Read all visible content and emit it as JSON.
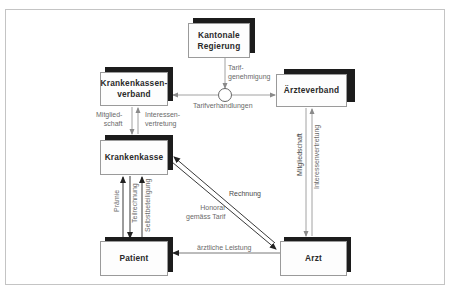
{
  "diagram": {
    "nodes": {
      "kantonale_regierung": "Kantonale\nRegierung",
      "krankenkassenverband": "Krankenkassen-\nverband",
      "aerzteverband": "Ärzteverband",
      "krankenkasse": "Krankenkasse",
      "patient": "Patient",
      "arzt": "Arzt"
    },
    "edges": {
      "tarifgenehmigung": "Tarif-\ngenehmigung",
      "tarifverhandlungen": "Tarifverhandlungen",
      "kkv_mitgliedschaft": "Mitglied-\nschaft",
      "kkv_interessenvertretung": "Interessen-\nvertretung",
      "aev_mitgliedschaft": "Mitgliedschaft",
      "aev_interessenvertretung": "Interessenvertretung",
      "praemie": "Prämie",
      "teilrechnung": "Teilrechnung",
      "selbstbeteiligung": "Selbstbeteiligung",
      "rechnung": "Rechnung",
      "honorar": "Honorar\ngemäss Tarif",
      "aerztliche_leistung": "ärztliche Leistung"
    },
    "colors": {
      "box_shadow": "#1c1c1c",
      "box_border": "#9a9a9a",
      "line_gray": "#8a8a8a",
      "line_dark": "#2a2a2a",
      "frame": "#c4c4c4"
    }
  }
}
